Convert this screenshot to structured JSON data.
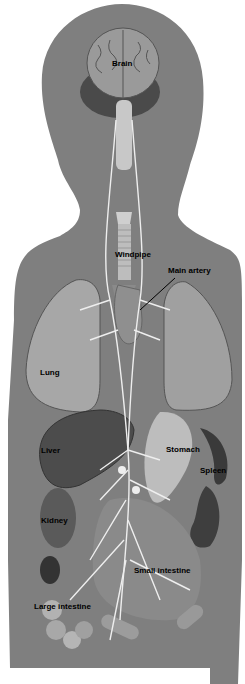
{
  "diagram": {
    "colors": {
      "background": "#ffffff",
      "silhouette": "#7f7f7f",
      "organ_light": "#b5b5b5",
      "organ_mid": "#8f8f8f",
      "organ_dark": "#3e3e3e",
      "nerve": "#eeeeee",
      "label_text": "#000000"
    },
    "labels": {
      "brain": "Brain",
      "windpipe": "Windpipe",
      "main_artery": "Main artery",
      "lung": "Lung",
      "liver": "Liver",
      "stomach": "Stomach",
      "spleen": "Spleen",
      "kidney": "Kidney",
      "small_intestine": "Small intestine",
      "large_intestine": "Large intestine"
    }
  }
}
